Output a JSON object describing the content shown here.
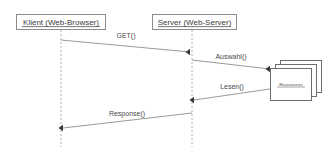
{
  "diagram": {
    "type": "uml-sequence-diagram",
    "background_color": "#ffffff",
    "line_color": "#9a9a9a",
    "box_border_color": "#8c8c8c",
    "text_color": "#3c3c3c",
    "participants": [
      {
        "id": "client",
        "label": "Klient (Web-Browser)",
        "lifeline_x": 61
      },
      {
        "id": "server",
        "label": "Server (Web-Server)",
        "lifeline_x": 192
      }
    ],
    "object_node": {
      "id": "ressourcen",
      "label": "Ressourcen",
      "stacked_copies": 3
    },
    "messages": [
      {
        "label": "GET()",
        "from": "client",
        "to": "server",
        "direction": "right"
      },
      {
        "label": "Auswahl()",
        "from": "server",
        "to": "ressourcen",
        "direction": "right"
      },
      {
        "label": "Lesen()",
        "from": "ressourcen",
        "to": "server",
        "direction": "left"
      },
      {
        "label": "Response()",
        "from": "server",
        "to": "client",
        "direction": "left"
      }
    ]
  }
}
